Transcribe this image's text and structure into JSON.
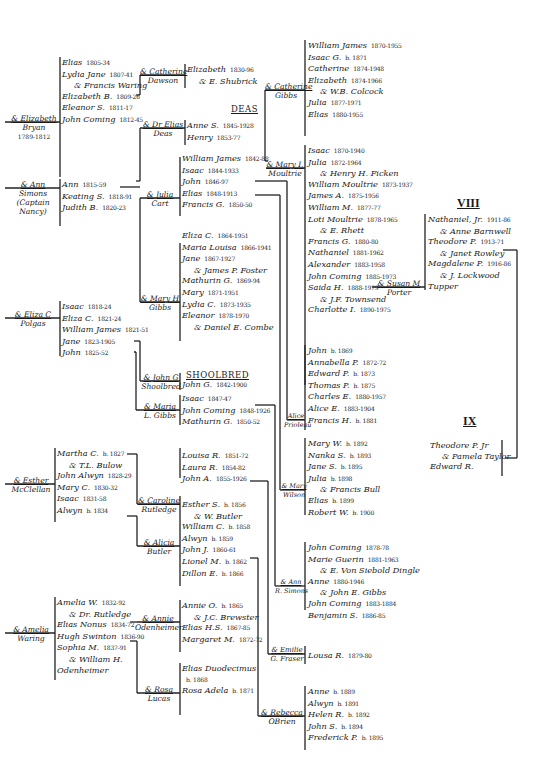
{
  "generations": {
    "viii": "VIII",
    "ix": "IX"
  },
  "headings": {
    "deas": "DEAS",
    "shoolbred": "SHOOLBRED"
  },
  "spouses": {
    "elizabeth_bryan": {
      "line1": "& Elizabeth",
      "line2": "Bryan",
      "line3": "1789-1812"
    },
    "ann_simons": {
      "line1": "& Ann",
      "line2": "Simons",
      "line3": "(Captain",
      "line4": "Nancy)"
    },
    "eliza_polgas": {
      "line1": "& Eliza C",
      "line2": "Polgas"
    },
    "esther_mcclellan": {
      "line1": "& Esther",
      "line2": "McClellan"
    },
    "amelia_waring": {
      "line1": "& Amelia",
      "line2": "Waring"
    },
    "catherine_dawson": {
      "line1": "& Catherine",
      "line2": "Dawson"
    },
    "dr_elias_deas": {
      "line1": "& Dr Elias",
      "line2": "Deas"
    },
    "julia_cart": {
      "line1": "& Julia",
      "line2": "Cart"
    },
    "mary_gibbs": {
      "line1": "& Mary H",
      "line2": "Gibbs"
    },
    "john_shoolbred": {
      "line1": "& John G",
      "line2": "Shoolbred"
    },
    "maria_gibbs": {
      "line1": "& Maria",
      "line2": "L. Gibbs"
    },
    "caroline_rutledge": {
      "line1": "& Caroline",
      "line2": "Rutledge"
    },
    "alicia_butler": {
      "line1": "& Alicia",
      "line2": "Butler"
    },
    "annie_odenheimer": {
      "line1": "& Annie",
      "line2": "Odenheimer"
    },
    "rosa_lucas": {
      "line1": "& Rosa",
      "line2": "Lucas"
    },
    "catherine_gibbs": {
      "line1": "& Catherine",
      "line2": "Gibbs"
    },
    "mary_moultrie": {
      "line1": "& Mary I.",
      "line2": "Moultrie"
    },
    "alice_prioleau": {
      "line1": "Alice",
      "line2": "Prioleau"
    },
    "mary_wilson": {
      "line1": "& Mary",
      "line2": "Wilson"
    },
    "ann_simons2": {
      "line1": "& Ann",
      "line2": "R. Simons"
    },
    "emilie_fraser": {
      "line1": "& Emilie",
      "line2": "G. Fraser"
    },
    "rebecca_obrien": {
      "line1": "& Rebecca",
      "line2": "OBrien"
    },
    "susan_porter": {
      "line1": "& Susan M",
      "line2": "Porter"
    }
  },
  "families": {
    "bryan_children": [
      {
        "name": "Elias",
        "dates": "1805-34"
      },
      {
        "name": "Lydia Jane",
        "dates": "1807-41"
      },
      {
        "name": "& Francis Waring",
        "dates": ""
      },
      {
        "name": "Elizabeth B.",
        "dates": "1809-26"
      },
      {
        "name": "Eleanor S.",
        "dates": "1811-17"
      },
      {
        "name": "John Coming",
        "dates": "1812-45"
      }
    ],
    "simons_children": [
      {
        "name": "Ann",
        "dates": "1815-59"
      },
      {
        "name": "Keating S.",
        "dates": "1818-91"
      },
      {
        "name": "Judith B.",
        "dates": "1820-23"
      }
    ],
    "polgas_children": [
      {
        "name": "Isaac",
        "dates": "1818-24"
      },
      {
        "name": "Eliza C.",
        "dates": "1821-24"
      },
      {
        "name": "William James",
        "dates": "1821-51"
      },
      {
        "name": "Jane",
        "dates": "1823-1905"
      },
      {
        "name": "John",
        "dates": "1825-52"
      }
    ],
    "mcclellan_children": [
      {
        "name": "Martha C.",
        "dates": "b. 1827"
      },
      {
        "name": "& T.L. Bulow",
        "dates": ""
      },
      {
        "name": "John Alwyn",
        "dates": "1828-29"
      },
      {
        "name": "Mary C.",
        "dates": "1830-32"
      },
      {
        "name": "Isaac",
        "dates": "1831-58"
      },
      {
        "name": "Alwyn",
        "dates": "b. 1834"
      }
    ],
    "waring_children": [
      {
        "name": "Amelia W.",
        "dates": "1832-92"
      },
      {
        "name": "& Dr. Rutledge",
        "dates": ""
      },
      {
        "name": "Elias Nonus",
        "dates": "1834-72"
      },
      {
        "name": "Hugh Swinton",
        "dates": "1836-90"
      },
      {
        "name": "Sophia M.",
        "dates": "1837-91"
      },
      {
        "name": "& William H.",
        "dates": ""
      },
      {
        "name": "Odenheimer",
        "dates": ""
      }
    ],
    "dawson_children": [
      {
        "name": "Elizabeth",
        "dates": "1830-96"
      },
      {
        "name": "& E. Shubrick",
        "dates": ""
      }
    ],
    "deas_children": [
      {
        "name": "Anne S.",
        "dates": "1845-1928"
      },
      {
        "name": "Henry",
        "dates": "1853-77"
      }
    ],
    "cart_children": [
      {
        "name": "William James",
        "dates": "1842-88"
      },
      {
        "name": "Isaac",
        "dates": "1844-1933"
      },
      {
        "name": "John",
        "dates": "1846-97"
      },
      {
        "name": "Elias",
        "dates": "1848-1913"
      },
      {
        "name": "Francis G.",
        "dates": "1850-50"
      }
    ],
    "gibbs_children": [
      {
        "name": "Eliza C.",
        "dates": "1864-1951"
      },
      {
        "name": "Maria Louisa",
        "dates": "1866-1941"
      },
      {
        "name": "Jane",
        "dates": "1867-1927"
      },
      {
        "name": "& James P. Foster",
        "dates": ""
      },
      {
        "name": "Mathurin G.",
        "dates": "1869-94"
      },
      {
        "name": "Mary",
        "dates": "1871-1951"
      },
      {
        "name": "Lydia C.",
        "dates": "1873-1935"
      },
      {
        "name": "Eleanor",
        "dates": "1878-1970"
      },
      {
        "name": "& Daniel E. Combe",
        "dates": ""
      }
    ],
    "shoolbred_children": [
      {
        "name": "John G.",
        "dates": "1842-1900"
      }
    ],
    "maria_gibbs_children": [
      {
        "name": "Isaac",
        "dates": "1847-47"
      },
      {
        "name": "John Coming",
        "dates": "1848-1926"
      },
      {
        "name": "Mathurin G.",
        "dates": "1850-52"
      }
    ],
    "rutledge_children": [
      {
        "name": "Louisa R.",
        "dates": "1851-72"
      },
      {
        "name": "Laura R.",
        "dates": "1854-82"
      },
      {
        "name": "John A.",
        "dates": "1855-1926"
      }
    ],
    "butler_children": [
      {
        "name": "Esther S.",
        "dates": "b. 1856"
      },
      {
        "name": "& W. Butler",
        "dates": ""
      },
      {
        "name": "William C.",
        "dates": "b. 1858"
      },
      {
        "name": "Alwyn",
        "dates": "b. 1859"
      },
      {
        "name": "John J.",
        "dates": "1860-61"
      },
      {
        "name": "Lionel M.",
        "dates": "b. 1862"
      },
      {
        "name": "Dillon E.",
        "dates": "b. 1866"
      }
    ],
    "odenheimer_children": [
      {
        "name": "Annie O.",
        "dates": "b. 1865"
      },
      {
        "name": "& J.C. Brewster",
        "dates": ""
      },
      {
        "name": "Elias H.S.",
        "dates": "1867-85"
      },
      {
        "name": "Margaret M.",
        "dates": "1872-72"
      }
    ],
    "lucas_children": [
      {
        "name": "Elias Duodecimus",
        "dates": ""
      },
      {
        "name": "",
        "dates": "b. 1868"
      },
      {
        "name": "Rosa Adela",
        "dates": "b. 1871"
      }
    ],
    "catherine_gibbs_children": [
      {
        "name": "William James",
        "dates": "1870-1955"
      },
      {
        "name": "Isaac G.",
        "dates": "b. 1871"
      },
      {
        "name": "Catherine",
        "dates": "1874-1948"
      },
      {
        "name": "Elizabeth",
        "dates": "1874-1966"
      },
      {
        "name": "& W.B. Colcock",
        "dates": ""
      },
      {
        "name": "Julia",
        "dates": "1877-1971"
      },
      {
        "name": "Elias",
        "dates": "1880-1955"
      }
    ],
    "moultrie_children": [
      {
        "name": "Isaac",
        "dates": "1870-1940"
      },
      {
        "name": "Julia",
        "dates": "1872-1964"
      },
      {
        "name": "& Henry H. Ficken",
        "dates": ""
      },
      {
        "name": "William Moultrie",
        "dates": "1873-1937"
      },
      {
        "name": "James A.",
        "dates": "1875-1956"
      },
      {
        "name": "William M.",
        "dates": "1877-77"
      },
      {
        "name": "Loti Moultrie",
        "dates": "1878-1965"
      },
      {
        "name": "& E. Rhett",
        "dates": ""
      },
      {
        "name": "Francis G.",
        "dates": "1880-80"
      },
      {
        "name": "Nathaniel",
        "dates": "1881-1962"
      },
      {
        "name": "Alexander",
        "dates": "1883-1958"
      },
      {
        "name": "John Coming",
        "dates": "1885-1973"
      },
      {
        "name": "Saida H.",
        "dates": "1888-1979"
      },
      {
        "name": "& J.F. Townsend",
        "dates": ""
      },
      {
        "name": "Charlotte I.",
        "dates": "1890-1975"
      }
    ],
    "prioleau_children": [
      {
        "name": "John",
        "dates": "b. 1869"
      },
      {
        "name": "Annabella P.",
        "dates": "1872-72"
      },
      {
        "name": "Edward P.",
        "dates": "b. 1873"
      },
      {
        "name": "Thomas P.",
        "dates": "b. 1875"
      },
      {
        "name": "Charles E.",
        "dates": "1880-1957"
      },
      {
        "name": "Alice E.",
        "dates": "1883-1904"
      },
      {
        "name": "Francis H.",
        "dates": "b. 1881"
      }
    ],
    "wilson_children": [
      {
        "name": "Mary W.",
        "dates": "b. 1892"
      },
      {
        "name": "Nanka S.",
        "dates": "b. 1893"
      },
      {
        "name": "Jane S.",
        "dates": "b. 1895"
      },
      {
        "name": "Julia",
        "dates": "b. 1898"
      },
      {
        "name": "& Francis Bull",
        "dates": ""
      },
      {
        "name": "Elias",
        "dates": "b. 1899"
      },
      {
        "name": "Robert W.",
        "dates": "b. 1900"
      }
    ],
    "simons2_children": [
      {
        "name": "John Coming",
        "dates": "1878-78"
      },
      {
        "name": "Marie Guerin",
        "dates": "1881-1963"
      },
      {
        "name": "& E. Von Siebold Dingle",
        "dates": ""
      },
      {
        "name": "Anne",
        "dates": "1880-1946"
      },
      {
        "name": "& John E. Gibbs",
        "dates": ""
      },
      {
        "name": "John Coming",
        "dates": "1883-1884"
      },
      {
        "name": "Benjamin S.",
        "dates": "1886-85"
      }
    ],
    "fraser_children": [
      {
        "name": "Lousa R.",
        "dates": "1879-80"
      }
    ],
    "obrien_children": [
      {
        "name": "Anne",
        "dates": "b. 1889"
      },
      {
        "name": "Alwyn",
        "dates": "b. 1891"
      },
      {
        "name": "Helen R.",
        "dates": "b. 1892"
      },
      {
        "name": "John S.",
        "dates": "b. 1894"
      },
      {
        "name": "Frederick P.",
        "dates": "b. 1895"
      }
    ],
    "porter_children": [
      {
        "name": "Nathaniel, Jr.",
        "dates": "1911-86"
      },
      {
        "name": "& Anne Barnwell",
        "dates": ""
      },
      {
        "name": "Theodore P.",
        "dates": "1913-71"
      },
      {
        "name": "& Janet Rowley",
        "dates": ""
      },
      {
        "name": "Magdalene P.",
        "dates": "1916-86"
      },
      {
        "name": "& J. Lockwood",
        "dates": ""
      },
      {
        "name": "Tupper",
        "dates": ""
      }
    ],
    "taylor_children": [
      {
        "name": "Theodore P. Jr",
        "dates": ""
      },
      {
        "name": "& Pamela Taylor",
        "dates": ""
      },
      {
        "name": "Edward R.",
        "dates": ""
      }
    ]
  }
}
